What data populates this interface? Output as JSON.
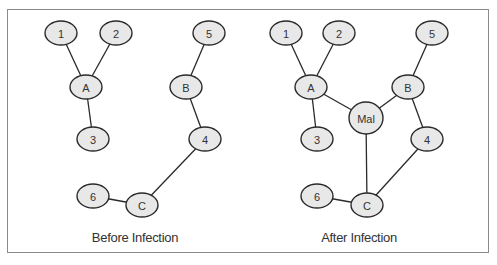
{
  "diagrams": [
    {
      "caption": "Before Infection",
      "caption_pos": [
        135,
        242
      ],
      "nodes": [
        {
          "id": "1",
          "label": "1",
          "x": 61,
          "y": 33,
          "rx": 16,
          "ry": 12
        },
        {
          "id": "2",
          "label": "2",
          "x": 116,
          "y": 33,
          "rx": 16,
          "ry": 12
        },
        {
          "id": "5",
          "label": "5",
          "x": 209,
          "y": 33,
          "rx": 16,
          "ry": 12
        },
        {
          "id": "A",
          "label": "A",
          "x": 86,
          "y": 87,
          "rx": 16,
          "ry": 12
        },
        {
          "id": "B",
          "label": "B",
          "x": 186,
          "y": 87,
          "rx": 16,
          "ry": 12
        },
        {
          "id": "3",
          "label": "3",
          "x": 93,
          "y": 139,
          "rx": 16,
          "ry": 12
        },
        {
          "id": "4",
          "label": "4",
          "x": 205,
          "y": 139,
          "rx": 16,
          "ry": 12
        },
        {
          "id": "6",
          "label": "6",
          "x": 93,
          "y": 196,
          "rx": 16,
          "ry": 12
        },
        {
          "id": "C",
          "label": "C",
          "x": 142,
          "y": 205,
          "rx": 16,
          "ry": 12
        }
      ],
      "edges": [
        [
          "1",
          "A"
        ],
        [
          "2",
          "A"
        ],
        [
          "A",
          "3"
        ],
        [
          "5",
          "B"
        ],
        [
          "B",
          "4"
        ],
        [
          "4",
          "C"
        ],
        [
          "6",
          "C"
        ]
      ]
    },
    {
      "caption": "After Infection",
      "caption_pos": [
        359,
        242
      ],
      "nodes": [
        {
          "id": "1",
          "label": "1",
          "x": 286,
          "y": 33,
          "rx": 16,
          "ry": 12
        },
        {
          "id": "2",
          "label": "2",
          "x": 339,
          "y": 33,
          "rx": 16,
          "ry": 12
        },
        {
          "id": "5",
          "label": "5",
          "x": 432,
          "y": 33,
          "rx": 16,
          "ry": 12
        },
        {
          "id": "A",
          "label": "A",
          "x": 311,
          "y": 87,
          "rx": 16,
          "ry": 12
        },
        {
          "id": "B",
          "label": "B",
          "x": 408,
          "y": 87,
          "rx": 16,
          "ry": 12
        },
        {
          "id": "Mal",
          "label": "Mal",
          "x": 366,
          "y": 118,
          "rx": 17,
          "ry": 16
        },
        {
          "id": "3",
          "label": "3",
          "x": 317,
          "y": 139,
          "rx": 16,
          "ry": 12
        },
        {
          "id": "4",
          "label": "4",
          "x": 427,
          "y": 139,
          "rx": 16,
          "ry": 12
        },
        {
          "id": "6",
          "label": "6",
          "x": 317,
          "y": 196,
          "rx": 16,
          "ry": 12
        },
        {
          "id": "C",
          "label": "C",
          "x": 367,
          "y": 205,
          "rx": 16,
          "ry": 12
        }
      ],
      "edges": [
        [
          "1",
          "A"
        ],
        [
          "2",
          "A"
        ],
        [
          "A",
          "3"
        ],
        [
          "5",
          "B"
        ],
        [
          "B",
          "4"
        ],
        [
          "4",
          "C"
        ],
        [
          "6",
          "C"
        ],
        [
          "A",
          "Mal"
        ],
        [
          "B",
          "Mal"
        ],
        [
          "Mal",
          "C"
        ]
      ]
    }
  ],
  "colors": {
    "node_fill": "#e8e8e8",
    "node_stroke": "#2a2a2a",
    "edge": "#2a2a2a",
    "frame": "#8a8a8a"
  }
}
